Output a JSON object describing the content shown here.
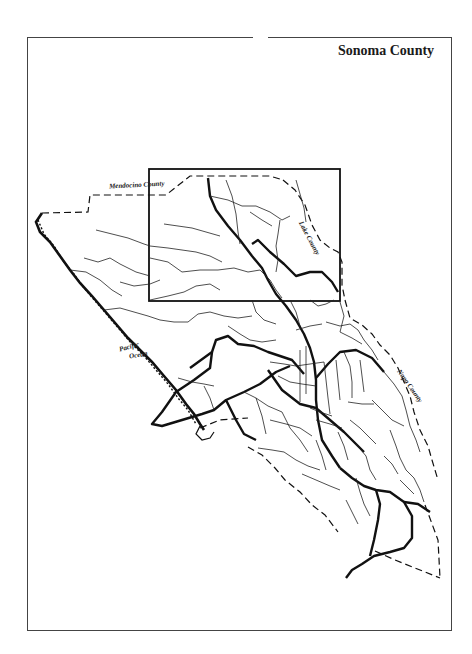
{
  "map": {
    "title": "Sonoma County",
    "labels": {
      "mendocino": "Mendocino County",
      "lake": "Lake County",
      "napa": "Napa County",
      "pacific_line1": "Pacific",
      "pacific_line2": "Ocean"
    },
    "inset_box": {
      "x": 149,
      "y": 169,
      "width": 191,
      "height": 132
    },
    "colors": {
      "ink": "#111111",
      "frame": "#444444",
      "background": "#ffffff"
    }
  }
}
